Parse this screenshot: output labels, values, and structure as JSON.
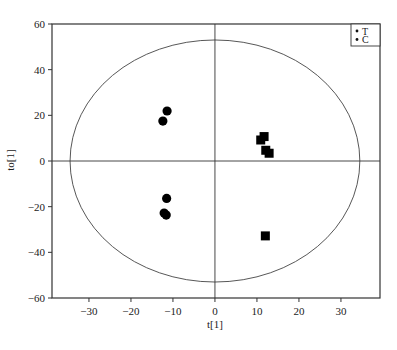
{
  "chart_data": {
    "type": "scatter",
    "title": "",
    "xlabel": "t[1]",
    "ylabel": "to[1]",
    "xlim": [
      -38.8,
      39.3
    ],
    "ylim": [
      -60,
      60
    ],
    "xticks": [
      -30,
      -20,
      -10,
      0,
      10,
      20,
      30
    ],
    "yticks": [
      -60,
      -40,
      -20,
      0,
      20,
      40,
      60
    ],
    "grid": false,
    "reference_lines": {
      "x": 0,
      "y": 0
    },
    "confidence_ellipse": {
      "cx": 0,
      "cy": 0,
      "rx": 34.5,
      "ry": 53
    },
    "legend": {
      "position": "top-right",
      "entries": [
        "T",
        "C"
      ]
    },
    "series": [
      {
        "name": "C",
        "marker": "circle",
        "color": "#000000",
        "points": [
          {
            "x": -12.4,
            "y": 17.5
          },
          {
            "x": -11.4,
            "y": 21.9
          },
          {
            "x": -11.5,
            "y": -16.4
          },
          {
            "x": -12.1,
            "y": -22.8
          },
          {
            "x": -11.6,
            "y": -23.7
          }
        ]
      },
      {
        "name": "T",
        "marker": "square",
        "color": "#000000",
        "points": [
          {
            "x": 11.7,
            "y": 10.7
          },
          {
            "x": 10.9,
            "y": 9.2
          },
          {
            "x": 12.1,
            "y": 4.7
          },
          {
            "x": 12.9,
            "y": 3.4
          },
          {
            "x": 12.0,
            "y": -32.8
          }
        ]
      }
    ]
  },
  "legend_labels": [
    "T",
    "C"
  ],
  "axes": {
    "x_title": "t[1]",
    "y_title": "to[1]"
  },
  "colors": {
    "ink": "#111111",
    "frame": "#333333",
    "background": "#ffffff"
  }
}
